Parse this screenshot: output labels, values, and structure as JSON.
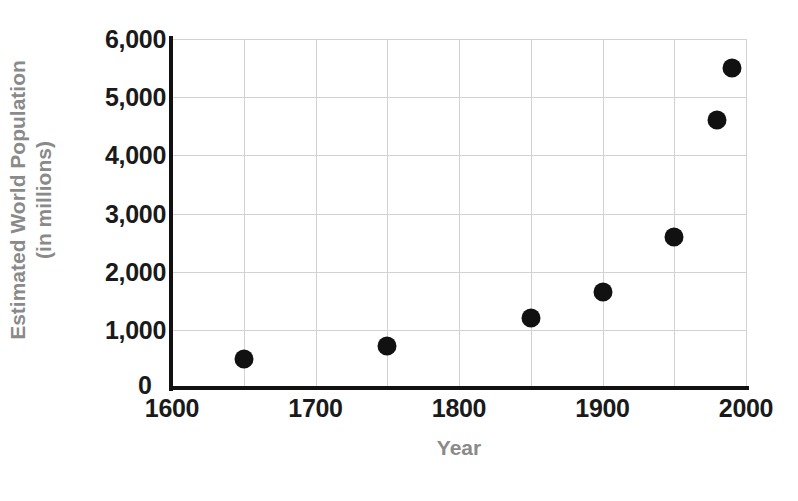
{
  "chart_data": {
    "type": "scatter",
    "title": "",
    "xlabel": "Year",
    "ylabel_line1": "Estimated World Population",
    "ylabel_line2": "(in millions)",
    "xlim": [
      1600,
      2000
    ],
    "ylim": [
      0,
      6000
    ],
    "grid": true,
    "legend": "none",
    "x_ticks": [
      "1600",
      "1700",
      "1800",
      "1900",
      "2000"
    ],
    "x_tick_values": [
      1600,
      1700,
      1800,
      1900,
      2000
    ],
    "y_ticks": [
      "0",
      "1,000",
      "2,000",
      "3,000",
      "4,000",
      "5,000",
      "6,000"
    ],
    "y_tick_values": [
      0,
      1000,
      2000,
      3000,
      4000,
      5000,
      6000
    ],
    "x_gridline_values": [
      1600,
      1650,
      1700,
      1750,
      1800,
      1850,
      1900,
      1950,
      2000
    ],
    "y_gridline_values": [
      1000,
      2000,
      3000,
      4000,
      5000,
      6000
    ],
    "marker": "filled-circle",
    "marker_color": "#111111",
    "grid_color": "#d2d2d2",
    "axis_color": "#111111",
    "axis_label_color": "#8a8a8a",
    "tick_label_color": "#1a1a1a",
    "background_color": "#ffffff",
    "points": [
      {
        "x": 1650,
        "y": 500
      },
      {
        "x": 1750,
        "y": 730
      },
      {
        "x": 1850,
        "y": 1200
      },
      {
        "x": 1900,
        "y": 1650
      },
      {
        "x": 1950,
        "y": 2600
      },
      {
        "x": 1980,
        "y": 4600
      },
      {
        "x": 1990,
        "y": 5500
      }
    ]
  }
}
